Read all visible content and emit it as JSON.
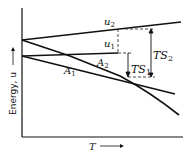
{
  "diagram": {
    "y_axis_label": "Energy, u",
    "x_axis_label": "T",
    "curves": [
      {
        "name": "u2",
        "label": "u",
        "sub": "2"
      },
      {
        "name": "u1",
        "label": "u",
        "sub": "1"
      },
      {
        "name": "A2",
        "label": "A",
        "sub": "2"
      },
      {
        "name": "A1",
        "label": "A",
        "sub": "1"
      }
    ],
    "annotations": [
      {
        "name": "TS2",
        "label": "TS",
        "sub": "2"
      },
      {
        "name": "TS1",
        "label": "TS",
        "sub": "1"
      }
    ]
  }
}
